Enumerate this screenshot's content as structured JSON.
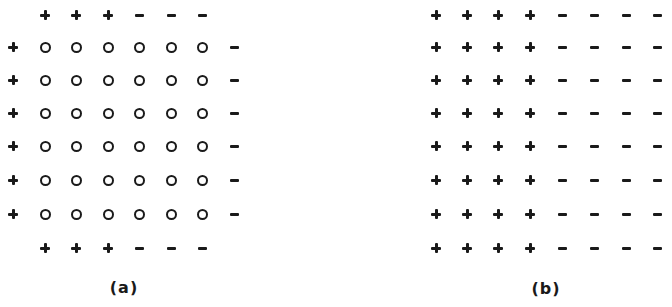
{
  "figure": {
    "panels": [
      {
        "id": "a",
        "label": "(a)",
        "label_pos": [
          124,
          287
        ],
        "description": "6x6 grid of interior points (o) bordered by + on left and top/bottom-left, - on right and top/bottom-right",
        "cols_x": [
          13,
          45,
          76,
          108,
          139,
          171,
          202,
          234
        ],
        "rows_y": [
          15,
          47,
          80,
          113,
          146,
          180,
          214,
          248
        ],
        "grid": [
          [
            " ",
            "+",
            "+",
            "+",
            "-",
            "-",
            "-",
            " "
          ],
          [
            "+",
            "o",
            "o",
            "o",
            "o",
            "o",
            "o",
            "-"
          ],
          [
            "+",
            "o",
            "o",
            "o",
            "o",
            "o",
            "o",
            "-"
          ],
          [
            "+",
            "o",
            "o",
            "o",
            "o",
            "o",
            "o",
            "-"
          ],
          [
            "+",
            "o",
            "o",
            "o",
            "o",
            "o",
            "o",
            "-"
          ],
          [
            "+",
            "o",
            "o",
            "o",
            "o",
            "o",
            "o",
            "-"
          ],
          [
            "+",
            "o",
            "o",
            "o",
            "o",
            "o",
            "o",
            "-"
          ],
          [
            " ",
            "+",
            "+",
            "+",
            "-",
            "-",
            "-",
            " "
          ]
        ]
      },
      {
        "id": "b",
        "label": "(b)",
        "label_pos": [
          546,
          288
        ],
        "description": "8x8 grid: left four columns +, right four columns -",
        "cols_x": [
          436,
          467,
          498,
          530,
          562,
          594,
          626,
          657
        ],
        "rows_y": [
          15,
          47,
          80,
          113,
          146,
          180,
          214,
          248
        ],
        "grid": [
          [
            "+",
            "+",
            "+",
            "+",
            "-",
            "-",
            "-",
            "-"
          ],
          [
            "+",
            "+",
            "+",
            "+",
            "-",
            "-",
            "-",
            "-"
          ],
          [
            "+",
            "+",
            "+",
            "+",
            "-",
            "-",
            "-",
            "-"
          ],
          [
            "+",
            "+",
            "+",
            "+",
            "-",
            "-",
            "-",
            "-"
          ],
          [
            "+",
            "+",
            "+",
            "+",
            "-",
            "-",
            "-",
            "-"
          ],
          [
            "+",
            "+",
            "+",
            "+",
            "-",
            "-",
            "-",
            "-"
          ],
          [
            "+",
            "+",
            "+",
            "+",
            "-",
            "-",
            "-",
            "-"
          ],
          [
            "+",
            "+",
            "+",
            "+",
            "-",
            "-",
            "-",
            "-"
          ]
        ]
      }
    ],
    "symbol_legend": {
      "+": "plus-sign",
      "-": "minus-sign",
      "o": "open-circle"
    }
  }
}
